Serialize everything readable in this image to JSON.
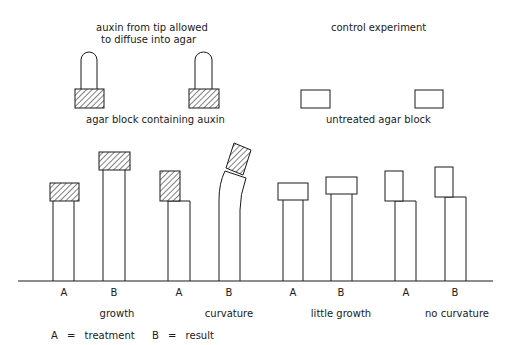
{
  "diagram": {
    "top": {
      "auxin_caption_line1": "auxin from tip allowed",
      "auxin_caption_line2": "to diffuse into agar",
      "control_caption": "control experiment",
      "agar_with_auxin_label": "agar block containing auxin",
      "untreated_agar_label": "untreated agar block"
    },
    "bottom": {
      "plants": [
        {
          "letter": "A",
          "block": "auxin",
          "position": "centered"
        },
        {
          "letter": "B",
          "block": "auxin",
          "position": "centered"
        },
        {
          "letter": "A",
          "block": "auxin",
          "position": "offset-left"
        },
        {
          "letter": "B",
          "block": "auxin",
          "position": "tilted"
        },
        {
          "letter": "A",
          "block": "untreated",
          "position": "centered"
        },
        {
          "letter": "B",
          "block": "untreated",
          "position": "centered"
        },
        {
          "letter": "A",
          "block": "untreated",
          "position": "offset-left"
        },
        {
          "letter": "B",
          "block": "untreated",
          "position": "offset-left"
        }
      ],
      "results": [
        "growth",
        "curvature",
        "little growth",
        "no curvature"
      ]
    },
    "legend": {
      "a_key": "A",
      "a_eq": "=",
      "a_value": "treatment",
      "b_key": "B",
      "b_eq": "=",
      "b_value": "result"
    }
  }
}
